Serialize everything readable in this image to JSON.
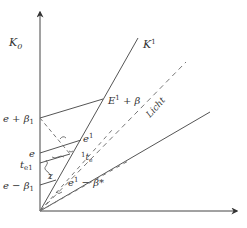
{
  "diagram": {
    "axes": {
      "vertical_label": "K",
      "vertical_sub": "0",
      "horizontal_label": ""
    },
    "lines": {
      "k1_label": "K",
      "k1_sup": "1",
      "light_label": "Licht"
    },
    "left_ticks": [
      {
        "id": "e_plus_beta1",
        "text": "e + β",
        "sub": "1"
      },
      {
        "id": "e",
        "text": "e",
        "sub": ""
      },
      {
        "id": "t_e1",
        "text": "t",
        "sub": "e1"
      },
      {
        "id": "e_minus_beta1",
        "text": "e − β",
        "sub": "1"
      }
    ],
    "points": {
      "E1_plus_beta": {
        "text": "E",
        "sup": "1",
        "rest": " + β"
      },
      "e1": {
        "text": "e",
        "sup": "1"
      },
      "t_e": {
        "pre": "1",
        "text": "t",
        "sub": "e"
      },
      "e1_minus_beta": {
        "text": "e",
        "sup": "1",
        "rest": " − β*"
      },
      "z": {
        "text": "z"
      }
    },
    "colors": {
      "line": "#555555",
      "text": "#333333",
      "dashed": "#777777"
    }
  }
}
